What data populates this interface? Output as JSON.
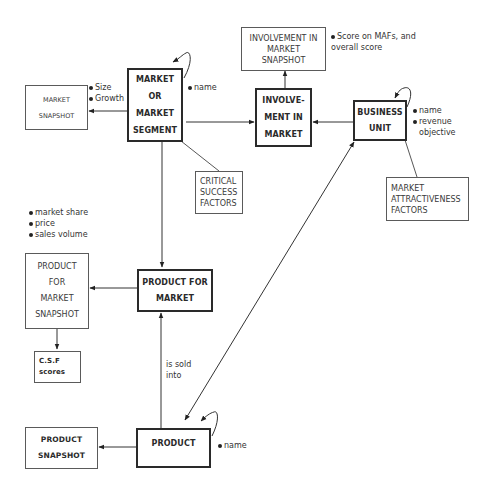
{
  "entities": {
    "market_segment": {
      "lines": [
        "MARKET",
        "OR",
        "MARKET",
        "SEGMENT"
      ],
      "style": "primary"
    },
    "involvement_in_market": {
      "lines": [
        "INVOLVE-",
        "MENT IN",
        "MARKET"
      ],
      "style": "primary"
    },
    "business_unit": {
      "lines": [
        "BUSINESS",
        "UNIT"
      ],
      "style": "primary"
    },
    "product_for_market": {
      "lines": [
        "PRODUCT FOR",
        "MARKET"
      ],
      "style": "primary"
    },
    "product": {
      "lines": [
        "PRODUCT"
      ],
      "style": "primary"
    },
    "market_snapshot": {
      "lines": [
        "MARKET",
        "SNAPSHOT"
      ],
      "style": "secondary"
    },
    "involvement_snapshot": {
      "lines": [
        "INVOLVEMENT IN",
        "MARKET",
        "SNAPSHOT"
      ],
      "style": "secondary"
    },
    "critical_success_factors": {
      "lines": [
        "CRITICAL",
        "SUCCESS",
        "FACTORS"
      ],
      "style": "secondary"
    },
    "market_attractiveness_factors": {
      "lines": [
        "MARKET",
        "ATTRACTIVENESS",
        "FACTORS"
      ],
      "style": "secondary"
    },
    "product_for_market_snapshot": {
      "lines": [
        "PRODUCT",
        "FOR",
        "MARKET",
        "SNAPSHOT"
      ],
      "style": "secondary"
    },
    "csf_scores": {
      "lines": [
        "C.S.F",
        "scores"
      ],
      "style": "secondary"
    },
    "product_snapshot": {
      "lines": [
        "PRODUCT",
        "SNAPSHOT"
      ],
      "style": "secondary"
    }
  },
  "attributes": {
    "market_snapshot": [
      "Size",
      "Growth"
    ],
    "market_segment": [
      "name"
    ],
    "involvement_snapshot": [
      "Score on MAFs, and",
      "overall score"
    ],
    "business_unit": [
      "name",
      "revenue",
      "objective"
    ],
    "product_for_market_snapshot": [
      "market share",
      "price",
      "sales volume"
    ],
    "product": [
      "name"
    ]
  },
  "relationships": {
    "product_to_product_for_market": "is sold into",
    "is_sold_lines": [
      "is sold",
      "into"
    ]
  },
  "edges": [
    {
      "from": "market_segment",
      "to": "market_snapshot",
      "type": "arrow"
    },
    {
      "from": "market_segment",
      "to": "involvement_in_market",
      "type": "arrow"
    },
    {
      "from": "business_unit",
      "to": "involvement_in_market",
      "type": "arrow"
    },
    {
      "from": "involvement_in_market",
      "to": "involvement_snapshot",
      "type": "arrow"
    },
    {
      "from": "market_segment",
      "to": "critical_success_factors",
      "type": "line"
    },
    {
      "from": "business_unit",
      "to": "market_attractiveness_factors",
      "type": "line"
    },
    {
      "from": "market_segment",
      "to": "product_for_market",
      "type": "arrow"
    },
    {
      "from": "product_for_market",
      "to": "product_for_market_snapshot",
      "type": "arrow"
    },
    {
      "from": "product_for_market_snapshot",
      "to": "csf_scores",
      "type": "arrow"
    },
    {
      "from": "product",
      "to": "product_for_market",
      "type": "arrow"
    },
    {
      "from": "product",
      "to": "business_unit",
      "type": "double-arrow"
    },
    {
      "from": "product",
      "to": "product_snapshot",
      "type": "arrow"
    },
    {
      "from": "market_segment",
      "to": "market_segment",
      "type": "self-loop"
    },
    {
      "from": "business_unit",
      "to": "business_unit",
      "type": "self-loop"
    },
    {
      "from": "product",
      "to": "product",
      "type": "self-loop"
    }
  ]
}
